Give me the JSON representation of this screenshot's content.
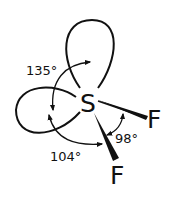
{
  "diagram": {
    "central_atom": "S",
    "ligands": [
      {
        "label": "F",
        "position": "right"
      },
      {
        "label": "F",
        "position": "bottom"
      }
    ],
    "lone_pairs": [
      {
        "position": "top"
      },
      {
        "position": "left"
      }
    ],
    "angles": [
      {
        "label": "135°",
        "between": "lone pair (top) – lone pair (left)"
      },
      {
        "label": "104°",
        "between": "lone pair (left) – F (bottom)"
      },
      {
        "label": "98°",
        "between": "F (right) – F (bottom)"
      }
    ],
    "colors": {
      "stroke": "#111111",
      "background": "#ffffff"
    }
  }
}
